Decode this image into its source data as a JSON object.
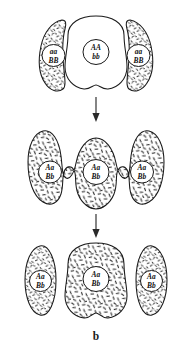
{
  "figure": {
    "caption": "b",
    "background_color": "#ffffff",
    "ink_color": "#1a1a1a",
    "stages": [
      {
        "id": "stage-top",
        "name": "parental-cells",
        "cells": [
          {
            "position": "left",
            "genotype_line1": "aa",
            "genotype_line2": "BB",
            "shaded": true
          },
          {
            "position": "center",
            "genotype_line1": "AA",
            "genotype_line2": "bb",
            "shaded": false
          },
          {
            "position": "right",
            "genotype_line1": "aa",
            "genotype_line2": "BB",
            "shaded": true
          }
        ]
      },
      {
        "id": "stage-middle",
        "name": "fused-cell-mass",
        "cells": [
          {
            "position": "left",
            "genotype_line1": "Aa",
            "genotype_line2": "Bb",
            "shaded": true
          },
          {
            "position": "center",
            "genotype_line1": "Aa",
            "genotype_line2": "Bb",
            "shaded": true
          },
          {
            "position": "right",
            "genotype_line1": "Aa",
            "genotype_line2": "Bb",
            "shaded": true
          }
        ]
      },
      {
        "id": "stage-bottom",
        "name": "separated-daughter-cells",
        "cells": [
          {
            "position": "left",
            "genotype_line1": "Aa",
            "genotype_line2": "Bb",
            "shaded": true
          },
          {
            "position": "center",
            "genotype_line1": "Aa",
            "genotype_line2": "Bb",
            "shaded": true
          },
          {
            "position": "right",
            "genotype_line1": "Aa",
            "genotype_line2": "Bb",
            "shaded": true
          }
        ]
      }
    ],
    "arrows": [
      {
        "id": "arrow-top-to-middle",
        "direction": "down"
      },
      {
        "id": "arrow-middle-to-bottom",
        "direction": "down"
      }
    ]
  }
}
